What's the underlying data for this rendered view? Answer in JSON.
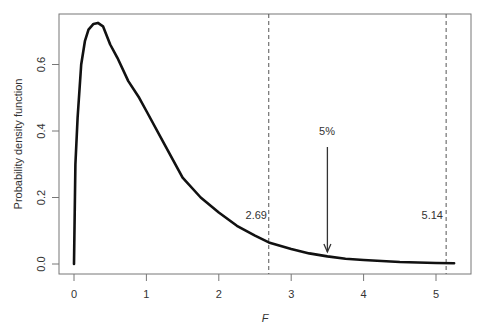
{
  "chart_data": {
    "type": "line",
    "title": "",
    "xlabel": "F",
    "ylabel": "Probability density function",
    "xlim": [
      0,
      5.25
    ],
    "ylim": [
      0,
      0.73
    ],
    "x_ticks": [
      0,
      1,
      2,
      3,
      4,
      5
    ],
    "x_tick_labels": [
      "0",
      "1",
      "2",
      "3",
      "4",
      "5"
    ],
    "y_ticks": [
      0.0,
      0.2,
      0.4,
      0.6
    ],
    "y_tick_labels": [
      "0.0",
      "0.2",
      "0.4",
      "0.6"
    ],
    "grid": false,
    "legend": null,
    "series": [
      {
        "name": "F density",
        "x": [
          0,
          0.02,
          0.05,
          0.1,
          0.15,
          0.2,
          0.27,
          0.33,
          0.4,
          0.5,
          0.6,
          0.75,
          0.9,
          1.0,
          1.25,
          1.5,
          1.75,
          2.0,
          2.25,
          2.5,
          2.69,
          3.0,
          3.25,
          3.5,
          3.75,
          4.0,
          4.5,
          5.0,
          5.25
        ],
        "values": [
          0,
          0.3,
          0.44,
          0.6,
          0.67,
          0.705,
          0.722,
          0.725,
          0.715,
          0.66,
          0.62,
          0.55,
          0.5,
          0.46,
          0.36,
          0.26,
          0.2,
          0.155,
          0.115,
          0.085,
          0.065,
          0.045,
          0.032,
          0.023,
          0.016,
          0.012,
          0.006,
          0.003,
          0.002
        ]
      }
    ],
    "reference_lines": [
      {
        "orientation": "vertical",
        "x": 2.69,
        "style": "dashed",
        "label": "2.69"
      },
      {
        "orientation": "vertical",
        "x": 5.14,
        "style": "dashed",
        "label": "5.14"
      }
    ],
    "annotations": [
      {
        "text": "5%",
        "type": "arrow",
        "x": 3.5,
        "y_from": 0.35,
        "y_to": 0.035
      }
    ]
  },
  "labels": {
    "xlabel": "F",
    "ylabel": "Probability density function",
    "crit1": "2.69",
    "crit2": "5.14",
    "tail": "5%"
  }
}
